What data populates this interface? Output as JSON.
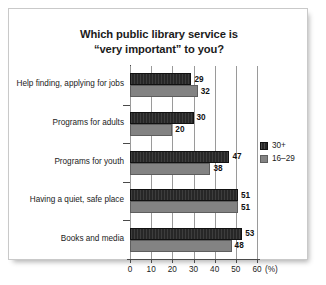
{
  "chart_data": {
    "type": "bar",
    "orientation": "horizontal",
    "title": "Which public library service is\n“very important” to you?",
    "xlabel": "(%)",
    "ylabel": "",
    "xlim": [
      0,
      60
    ],
    "xticks": [
      0,
      10,
      20,
      30,
      40,
      50,
      60
    ],
    "xticklabels": [
      "0",
      "10",
      "20",
      "30",
      "40",
      "50",
      "60"
    ],
    "grid": "vertical",
    "legend_position": "right",
    "categories": [
      "Help finding, applying for jobs",
      "Programs for adults",
      "Programs for youth",
      "Having a quiet, safe place",
      "Books and media"
    ],
    "series": [
      {
        "name": "30+",
        "color": "#272727",
        "values": [
          29,
          30,
          47,
          51,
          53
        ]
      },
      {
        "name": "16–29",
        "color": "#838383",
        "values": [
          32,
          20,
          38,
          51,
          48
        ]
      }
    ]
  },
  "colors": {
    "series_30plus": "#272727",
    "series_16to29": "#838383",
    "axis": "#4a4a4a",
    "gridline": "#9a9a9a",
    "text": "#1b1b1b",
    "card_background": "#ffffff",
    "card_border": "#c9c9c9",
    "page_background": "#ffffff"
  }
}
